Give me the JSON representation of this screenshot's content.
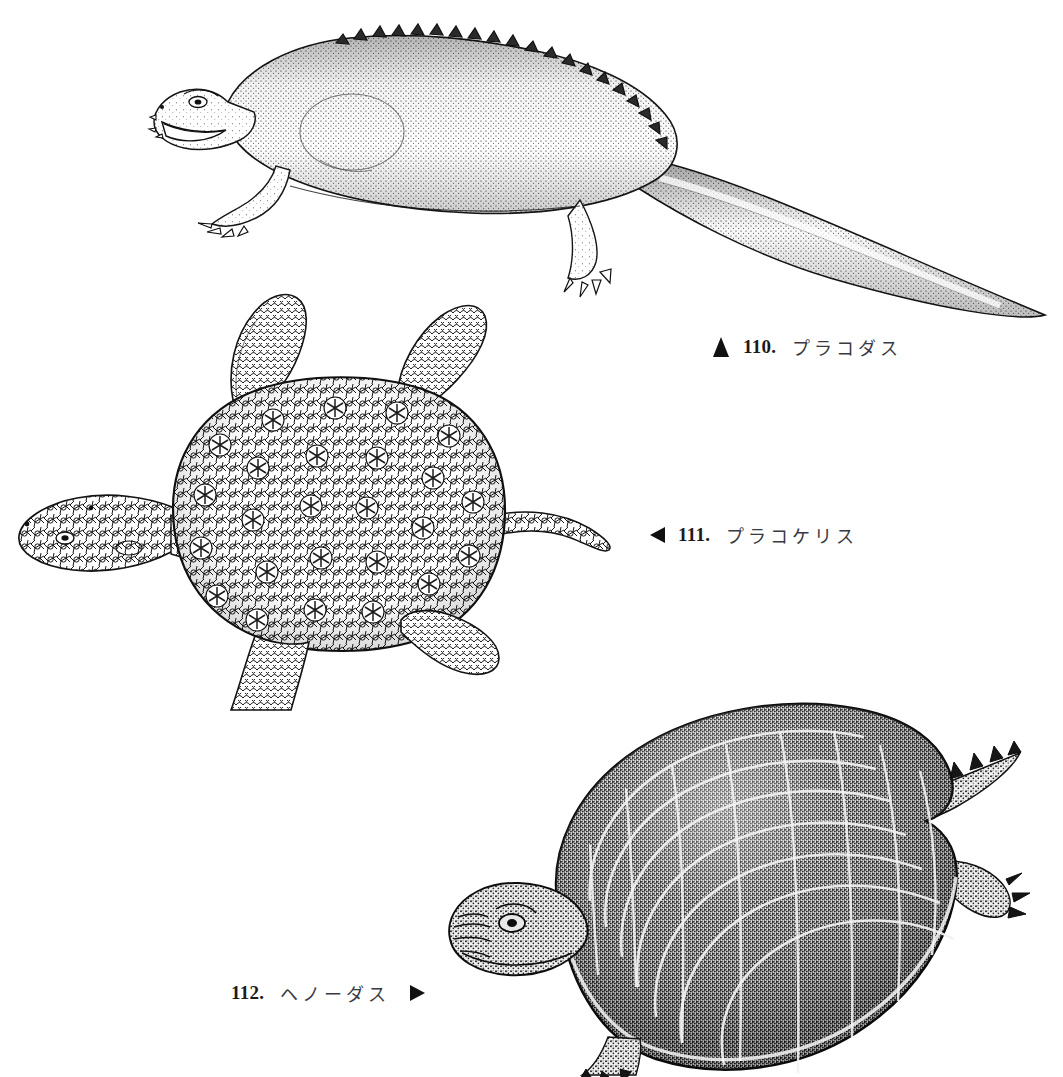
{
  "page": {
    "background_color": "#ffffff",
    "ink_color": "#111111",
    "style": "stippled pen-and-ink scientific illustration plate",
    "width": 1063,
    "height": 1077
  },
  "figures": [
    {
      "number": "110.",
      "name": "プラコダス",
      "marker": "triangle-up",
      "subject": "placodus-quadruped",
      "description": "lizard-like marine reptile in left-facing lateral view with long tapering tail and dorsal scute ridge"
    },
    {
      "number": "111.",
      "name": "プラコケリス",
      "marker": "triangle-left",
      "subject": "placochelys-dorsal",
      "description": "turtle-like armored reptile in dorsal view with four paddle limbs and tubercled carapace"
    },
    {
      "number": "112.",
      "name": "ヘノーダス",
      "marker": "triangle-right",
      "subject": "henodus-dorsal",
      "description": "broad flat-shelled placodont in dorsal view with dark plated carapace and spiked tail"
    }
  ]
}
